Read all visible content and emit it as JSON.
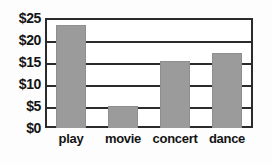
{
  "chart_data": {
    "type": "bar",
    "title": "",
    "subtitle": "",
    "xlabel": "",
    "ylabel": "",
    "categories": [
      "play",
      "movie",
      "concert",
      "dance"
    ],
    "values": [
      23.5,
      5,
      15.3,
      17
    ],
    "ylim": [
      0,
      25
    ],
    "ytick_values": [
      0,
      5,
      10,
      15,
      20,
      25
    ],
    "ytick_labels": [
      "$0",
      "$5",
      "$10",
      "$15",
      "$20",
      "$25"
    ],
    "grid": true,
    "grid_axis": "y",
    "legend": false,
    "legend_position": "none",
    "bar_color": "#9b9b9b",
    "axis_color": "#2b2b2b",
    "background_color": "#ffffff",
    "text_color": "#141414"
  }
}
